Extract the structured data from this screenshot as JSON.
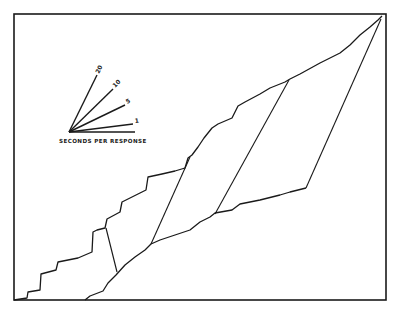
{
  "chart_data": {
    "type": "line",
    "title": "",
    "xlabel": "",
    "ylabel": "",
    "grid": false,
    "key": {
      "caption": "SECONDS PER RESPONSE",
      "rates": [
        {
          "label": "20",
          "x2": 97,
          "y2": 75
        },
        {
          "label": "10",
          "x2": 113,
          "y2": 89
        },
        {
          "label": "5",
          "x2": 125,
          "y2": 105
        },
        {
          "label": "1",
          "x2": 133,
          "y2": 124
        }
      ],
      "origin": [
        69,
        132
      ],
      "baseline_end": [
        135,
        132
      ]
    },
    "series": [
      {
        "name": "upper-cumulative-record",
        "points": [
          [
            14,
            300
          ],
          [
            27,
            298
          ],
          [
            28,
            292
          ],
          [
            40,
            290
          ],
          [
            41,
            274
          ],
          [
            56,
            270
          ],
          [
            58,
            262
          ],
          [
            78,
            258
          ],
          [
            92,
            252
          ],
          [
            93,
            232
          ],
          [
            97,
            230
          ],
          [
            105,
            228
          ],
          [
            107,
            219
          ],
          [
            120,
            212
          ],
          [
            122,
            202
          ],
          [
            140,
            193
          ],
          [
            146,
            190
          ],
          [
            148,
            177
          ],
          [
            162,
            174
          ],
          [
            175,
            171
          ],
          [
            185,
            168
          ],
          [
            188,
            158
          ],
          [
            192,
            155
          ],
          [
            198,
            147
          ],
          [
            204,
            138
          ],
          [
            212,
            128
          ],
          [
            218,
            124
          ],
          [
            232,
            118
          ],
          [
            238,
            106
          ],
          [
            245,
            102
          ],
          [
            260,
            94
          ],
          [
            270,
            88
          ],
          [
            285,
            82
          ],
          [
            290,
            79
          ],
          [
            300,
            74
          ],
          [
            320,
            63
          ],
          [
            340,
            53
          ],
          [
            350,
            45
          ],
          [
            360,
            35
          ],
          [
            370,
            27
          ],
          [
            378,
            20
          ],
          [
            382,
            16
          ]
        ]
      },
      {
        "name": "lower-cumulative-record",
        "points": [
          [
            85,
            300
          ],
          [
            90,
            296
          ],
          [
            103,
            291
          ],
          [
            108,
            283
          ],
          [
            116,
            275
          ],
          [
            125,
            265
          ],
          [
            135,
            257
          ],
          [
            145,
            250
          ],
          [
            151,
            244
          ],
          [
            160,
            240
          ],
          [
            175,
            235
          ],
          [
            190,
            230
          ],
          [
            200,
            222
          ],
          [
            210,
            217
          ],
          [
            215,
            213
          ],
          [
            232,
            210
          ],
          [
            240,
            204
          ],
          [
            260,
            200
          ],
          [
            280,
            195
          ],
          [
            290,
            192
          ],
          [
            306,
            188
          ]
        ]
      }
    ],
    "connectors": [
      {
        "from": [
          106,
          228
        ],
        "to": [
          117,
          272
        ]
      },
      {
        "from": [
          190,
          157
        ],
        "to": [
          151,
          244
        ]
      },
      {
        "from": [
          289,
          80
        ],
        "to": [
          215,
          214
        ]
      },
      {
        "from": [
          381,
          19
        ],
        "to": [
          306,
          188
        ]
      }
    ],
    "frame": {
      "x": 14,
      "y": 14,
      "width": 372,
      "height": 286
    }
  }
}
